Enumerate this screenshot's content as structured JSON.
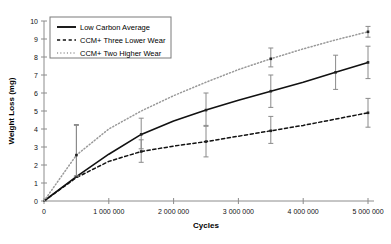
{
  "chart_data": {
    "type": "line",
    "title": "",
    "xlabel": "Cycles",
    "ylabel": "Weight Loss (mg)",
    "xlim": [
      0,
      5000000
    ],
    "ylim": [
      0,
      10
    ],
    "xticks": [
      0,
      1000000,
      2000000,
      3000000,
      4000000,
      5000000
    ],
    "xticklabels": [
      "0",
      "1 000 000",
      "2 000 000",
      "3 000 000",
      "4 000 000",
      "5 000 000"
    ],
    "yticks": [
      0,
      1,
      2,
      3,
      4,
      5,
      6,
      7,
      8,
      9,
      10
    ],
    "yticklabels": [
      "0",
      "1",
      "2",
      "3",
      "4",
      "5",
      "6",
      "7",
      "8",
      "9",
      "10"
    ],
    "grid": false,
    "legend_position": "upper-left",
    "series": [
      {
        "name": "Low Carbon Average",
        "style": "solid",
        "color": "#111111",
        "x": [
          0,
          500000,
          1000000,
          1500000,
          2000000,
          2500000,
          3000000,
          3500000,
          4000000,
          4500000,
          5000000
        ],
        "values": [
          0,
          1.35,
          2.6,
          3.7,
          4.45,
          5.05,
          5.6,
          6.1,
          6.6,
          7.15,
          7.7
        ],
        "errorbars": [
          {
            "x": 500000,
            "y": 1.35,
            "low": 1.35,
            "high": 4.2
          },
          {
            "x": 1500000,
            "y": 3.7,
            "low": 2.9,
            "high": 4.6
          },
          {
            "x": 2500000,
            "y": 5.05,
            "low": 4.2,
            "high": 6.0
          },
          {
            "x": 3500000,
            "y": 6.1,
            "low": 5.2,
            "high": 7.0
          },
          {
            "x": 4500000,
            "y": 7.15,
            "low": 6.2,
            "high": 8.1
          },
          {
            "x": 5000000,
            "y": 7.7,
            "low": 6.8,
            "high": 8.6
          }
        ]
      },
      {
        "name": "CCM+ Three Lower Wear",
        "style": "dashed",
        "color": "#111111",
        "x": [
          0,
          500000,
          1000000,
          1500000,
          2000000,
          2500000,
          3000000,
          3500000,
          4000000,
          4500000,
          5000000
        ],
        "values": [
          0,
          1.3,
          2.2,
          2.75,
          3.05,
          3.3,
          3.6,
          3.9,
          4.2,
          4.55,
          4.9
        ],
        "errorbars": [
          {
            "x": 1500000,
            "y": 2.75,
            "low": 2.15,
            "high": 3.4
          },
          {
            "x": 2500000,
            "y": 3.3,
            "low": 2.45,
            "high": 4.15
          },
          {
            "x": 3500000,
            "y": 3.9,
            "low": 3.2,
            "high": 4.7
          },
          {
            "x": 5000000,
            "y": 4.9,
            "low": 4.1,
            "high": 5.7
          }
        ]
      },
      {
        "name": "CCM+ Two Higher Wear",
        "style": "dotted",
        "color": "#999999",
        "x": [
          0,
          500000,
          1000000,
          1500000,
          2000000,
          2500000,
          3000000,
          3500000,
          4000000,
          4500000,
          5000000
        ],
        "values": [
          0,
          2.55,
          4.0,
          5.0,
          5.85,
          6.6,
          7.3,
          7.9,
          8.45,
          8.95,
          9.4
        ],
        "errorbars": [
          {
            "x": 500000,
            "y": 2.55,
            "low": 1.4,
            "high": 4.25
          },
          {
            "x": 3500000,
            "y": 7.9,
            "low": 7.45,
            "high": 8.5
          },
          {
            "x": 5000000,
            "y": 9.4,
            "low": 9.1,
            "high": 9.7
          }
        ]
      }
    ]
  },
  "legend": {
    "entries": [
      {
        "label": "Low Carbon Average"
      },
      {
        "label": "CCM+ Three Lower Wear"
      },
      {
        "label": "CCM+ Two Higher Wear"
      }
    ]
  }
}
